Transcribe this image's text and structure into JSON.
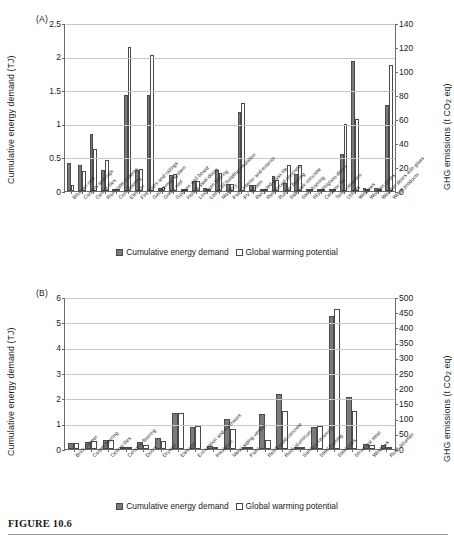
{
  "figure": {
    "caption": "FIGURE 10.6"
  },
  "legend": {
    "series_a_label": "Cumulative energy demand",
    "series_b_label": "Global warming potential",
    "series_a_color": "#7a7a7a",
    "series_b_color": "#ffffff"
  },
  "panel_a": {
    "tag": "(A)",
    "ylabel_left": "Cumulative energy demand (TJ)",
    "ylabel_right_pre": "GHG emissions (t CO",
    "ylabel_right_sub": "2",
    "ylabel_right_post": " eq)"
  },
  "panel_b": {
    "tag": "(B)",
    "ylabel_left": "Cumulative energy demand (TJ)",
    "ylabel_right_pre": "GHG emissions (t CO",
    "ylabel_right_sub": "2",
    "ylabel_right_post": " eq)"
  },
  "chart_data": [
    {
      "type": "bar",
      "panel": "(A)",
      "title": "",
      "xlabel": "",
      "ylabel": "Cumulative energy demand (TJ)",
      "ylabel_secondary": "GHG emissions (t CO2 eq)",
      "ylim": [
        0,
        2.5
      ],
      "yticks": [
        "0",
        "0.5",
        "1",
        "1.5",
        "2",
        "2.5"
      ],
      "ylim_secondary": [
        0,
        140
      ],
      "yticks_secondary": [
        "0",
        "20",
        "40",
        "60",
        "80",
        "100",
        "120",
        "140"
      ],
      "grid": true,
      "legend_position": "bottom",
      "categories": [
        "Bitumen roof",
        "Carpets and rugs",
        "Ceiling tiles",
        "Rainwater cisterns",
        "Cork flooring",
        "Elevator",
        "Fire stairs and railings",
        "Geothermal system",
        "Green roof",
        "Gypsum wall board",
        "Hollow steel doors",
        "Linoleum flooring",
        "Loose fill building insulation",
        "Masonry",
        "Paint interior and exterior",
        "PV system",
        "Recycled glass tile",
        "Reinforced concrete",
        "Rubber flooring",
        "Sidewalk concrete",
        "Steel framing",
        "Skylight/glass doors",
        "Ceramic tile",
        "Toilet ceramics",
        "Utilities",
        "Windows",
        "Wooden doors",
        "Wooden doors with glass",
        "Wood products"
      ],
      "series": [
        {
          "name": "Cumulative energy demand",
          "unit": "TJ",
          "axis": "left",
          "values": [
            0.41,
            0.39,
            0.85,
            0.31,
            0.01,
            1.43,
            0.31,
            1.43,
            0.05,
            0.24,
            0.02,
            0.15,
            0.04,
            0.31,
            0.1,
            1.17,
            0.09,
            0.01,
            0.22,
            0.12,
            0.25,
            0.01,
            0.02,
            0.02,
            0.55,
            1.93,
            0.04,
            0.04,
            1.28
          ]
        },
        {
          "name": "Global warming potential",
          "unit": "t CO2 eq",
          "axis": "right",
          "values": [
            5,
            17,
            35,
            26,
            1,
            120,
            18,
            113,
            3,
            14,
            1,
            8,
            2,
            15,
            6,
            73,
            5,
            1,
            9,
            22,
            22,
            1,
            1,
            1,
            56,
            60,
            2,
            2,
            105
          ]
        }
      ]
    },
    {
      "type": "bar",
      "panel": "(B)",
      "title": "",
      "xlabel": "",
      "ylabel": "Cumulative energy demand (TJ)",
      "ylabel_secondary": "GHG emissions (t CO2 eq)",
      "ylim": [
        0,
        6
      ],
      "yticks": [
        "0",
        "1",
        "2",
        "3",
        "4",
        "5",
        "6"
      ],
      "ylim_secondary": [
        0,
        500
      ],
      "yticks_secondary": [
        "0",
        "50",
        "100",
        "150",
        "200",
        "250",
        "300",
        "350",
        "400",
        "450",
        "500"
      ],
      "grid": true,
      "legend_position": "bottom",
      "categories": [
        "Brick veneer",
        "Carpet flooring",
        "Ceiling tiles",
        "Ceramic flooring",
        "Doors",
        "Drywall",
        "Elevator",
        "Excavation and earthwork",
        "Insulation",
        "Metal siding veneer",
        "Paint",
        "Reinforced concrete",
        "Roof–aluminum",
        "Sanitary ceramics",
        "Steel framing",
        "Steel piles",
        "Structural steel",
        "Windows",
        "Roof–bitumen"
      ],
      "series": [
        {
          "name": "Cumulative energy demand",
          "unit": "TJ",
          "axis": "left",
          "values": [
            0.22,
            0.29,
            0.34,
            0.05,
            0.26,
            0.44,
            1.43,
            0.86,
            0.13,
            1.19,
            0.06,
            1.39,
            2.17,
            0.03,
            0.88,
            5.26,
            2.04,
            0.19,
            0.16
          ]
        },
        {
          "name": "Global warming potential",
          "unit": "t CO2 eq",
          "axis": "right",
          "values": [
            21,
            26,
            29,
            4,
            14,
            27,
            119,
            75,
            8,
            67,
            5,
            30,
            126,
            2,
            75,
            462,
            126,
            14,
            6
          ]
        }
      ]
    }
  ]
}
